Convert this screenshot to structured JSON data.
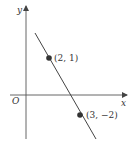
{
  "diagram": {
    "type": "coordinate-line-graph",
    "axes": {
      "x_label": "x",
      "y_label": "y",
      "origin_label": "O"
    },
    "points": [
      {
        "label": "(2, 1)",
        "x": 2,
        "y": 1
      },
      {
        "label": "(3, −2)",
        "x": 3,
        "y": -2
      }
    ],
    "colors": {
      "line": "#444444",
      "axis": "#555555",
      "point": "#333333",
      "background": "#ffffff"
    }
  }
}
